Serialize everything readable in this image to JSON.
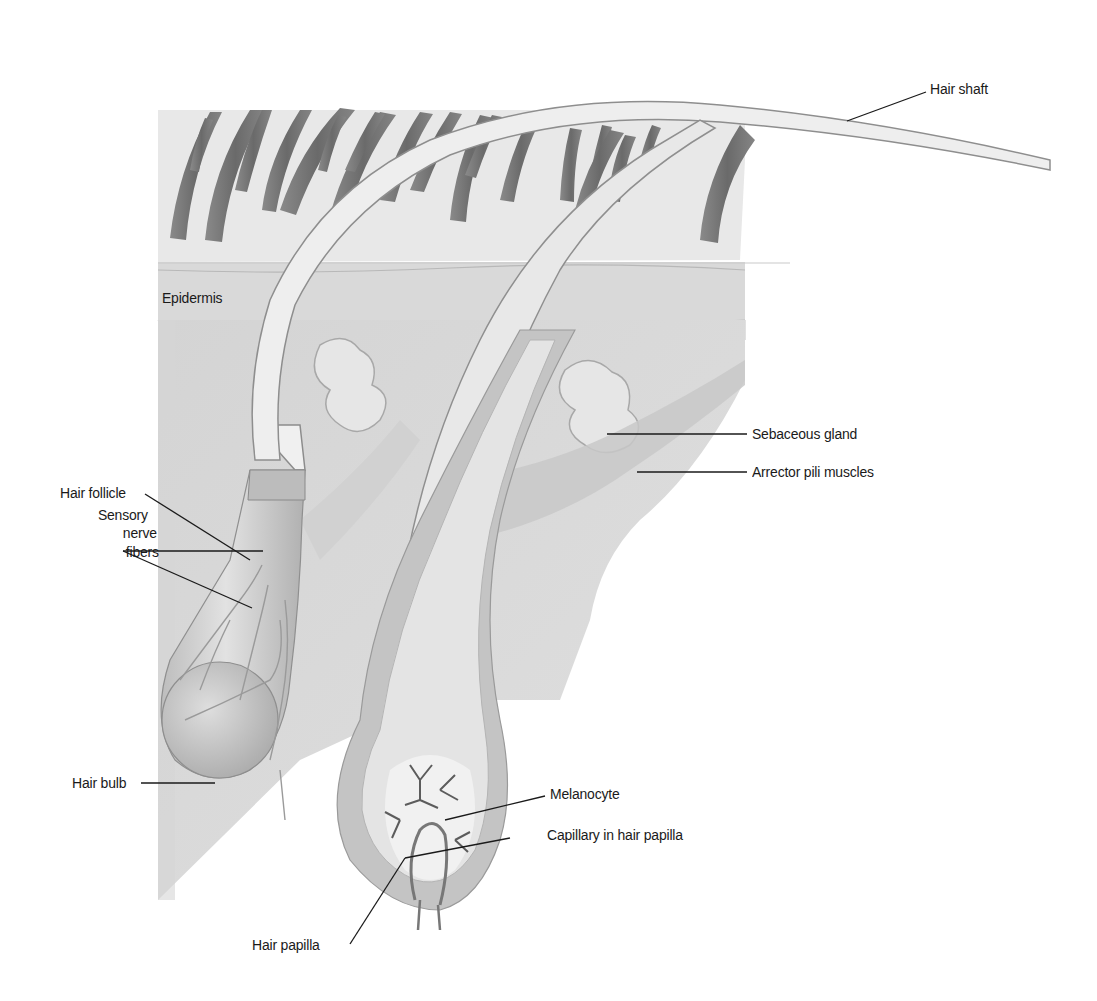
{
  "diagram": {
    "labels": {
      "hair_shaft": "Hair shaft",
      "epidermis": "Epidermis",
      "sebaceous_gland": "Sebaceous gland",
      "arrector_pili": "Arrector pili muscles",
      "hair_follicle": "Hair follicle",
      "sensory_nerve_line1": "Sensory",
      "sensory_nerve_line2": "nerve",
      "sensory_nerve_line3": "fibers",
      "hair_bulb": "Hair bulb",
      "melanocyte": "Melanocyte",
      "capillary": "Capillary in hair papilla",
      "hair_papilla": "Hair papilla"
    },
    "colors": {
      "background": "#ffffff",
      "skin_light": "#e6e6e6",
      "skin_mid": "#c9c9c9",
      "hair_dark": "#6e6e6e",
      "shaft": "#ececec",
      "leader_line": "#1a1a1a"
    }
  }
}
